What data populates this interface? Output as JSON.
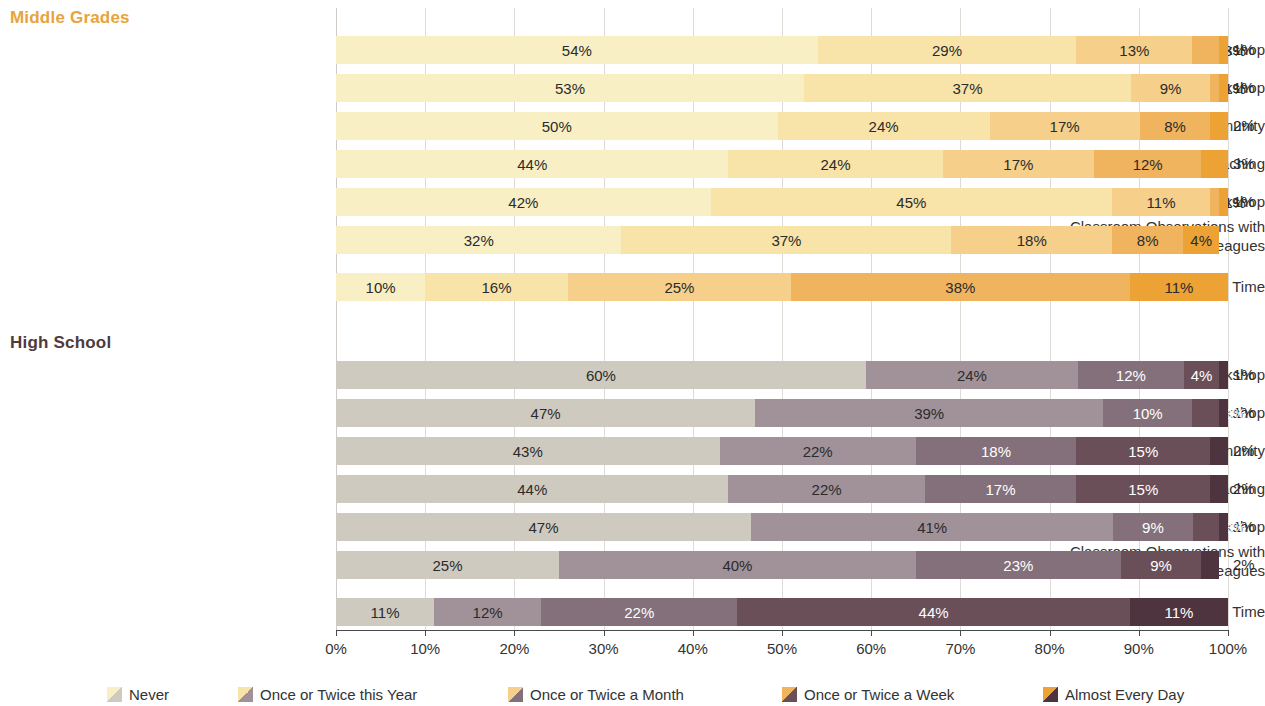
{
  "chart_data": {
    "type": "bar",
    "subtype": "stacked-horizontal-100pct",
    "title": "",
    "xlabel": "",
    "ylabel": "",
    "xlim": [
      0,
      100
    ],
    "grid": true,
    "legend_position": "bottom",
    "x_ticks": [
      "0%",
      "10%",
      "20%",
      "30%",
      "40%",
      "50%",
      "60%",
      "70%",
      "80%",
      "90%",
      "100%"
    ],
    "x_tick_values": [
      0,
      10,
      20,
      30,
      40,
      50,
      60,
      70,
      80,
      90,
      100
    ],
    "legend": [
      "Never",
      "Once or Twice this Year",
      "Once or Twice a Month",
      "Once or Twice a Week",
      "Almost Every Day"
    ],
    "categories": [
      "After-School Workshop",
      "Half-Day Workshop",
      "Professional Learning Community",
      "Instructional Coaching",
      "Full-Day Workshop",
      "Classroom Observations with\nOther Colleagues",
      "Collaborative Planning Time"
    ],
    "groups": [
      {
        "name": "Middle Grades",
        "palette": [
          "#f8efc4",
          "#f8e3a8",
          "#f6cf8a",
          "#f0b45e",
          "#eca234"
        ],
        "header_color": "#e8a33d",
        "rows": [
          {
            "category": "After-School Workshop",
            "values": [
              54,
              29,
              13,
              3,
              1
            ],
            "labels": [
              "54%",
              "29%",
              "13%",
              "3%",
              "1%"
            ]
          },
          {
            "category": "Half-Day Workshop",
            "values": [
              53,
              37,
              9,
              1,
              1
            ],
            "labels": [
              "53%",
              "37%",
              "9%",
              "1%",
              "1%"
            ]
          },
          {
            "category": "Professional Learning Community",
            "values": [
              50,
              24,
              17,
              8,
              2
            ],
            "labels": [
              "50%",
              "24%",
              "17%",
              "8%",
              "2%"
            ]
          },
          {
            "category": "Instructional Coaching",
            "values": [
              44,
              24,
              17,
              12,
              3
            ],
            "labels": [
              "44%",
              "24%",
              "17%",
              "12%",
              "3%"
            ]
          },
          {
            "category": "Full-Day Workshop",
            "values": [
              42,
              45,
              11,
              1,
              1
            ],
            "labels": [
              "42%",
              "45%",
              "11%",
              "1%",
              "1%"
            ]
          },
          {
            "category": "Classroom Observations with\nOther Colleagues",
            "values": [
              32,
              37,
              18,
              8,
              4
            ],
            "labels": [
              "32%",
              "37%",
              "18%",
              "8%",
              "4%"
            ]
          },
          {
            "category": "Collaborative Planning Time",
            "values": [
              10,
              16,
              25,
              38,
              11
            ],
            "labels": [
              "10%",
              "16%",
              "25%",
              "38%",
              "11%"
            ]
          }
        ]
      },
      {
        "name": "High School",
        "palette": [
          "#cfcabf",
          "#a1929a",
          "#83707a",
          "#6a4f59",
          "#4e343e"
        ],
        "header_color": "#4f3a40",
        "rows": [
          {
            "category": "After-School Workshop",
            "values": [
              60,
              24,
              12,
              4,
              1
            ],
            "labels": [
              "60%",
              "24%",
              "12%",
              "4%",
              "1%"
            ]
          },
          {
            "category": "Half-Day Workshop",
            "values": [
              47,
              39,
              10,
              3,
              1
            ],
            "labels": [
              "47%",
              "39%",
              "10%",
              "3%",
              "1%"
            ]
          },
          {
            "category": "Professional Learning Community",
            "values": [
              43,
              22,
              18,
              15,
              2
            ],
            "labels": [
              "43%",
              "22%",
              "18%",
              "15%",
              "2%"
            ]
          },
          {
            "category": "Instructional Coaching",
            "values": [
              44,
              22,
              17,
              15,
              2
            ],
            "labels": [
              "44%",
              "22%",
              "17%",
              "15%",
              "2%"
            ]
          },
          {
            "category": "Full-Day Workshop",
            "values": [
              47,
              41,
              9,
              3,
              1
            ],
            "labels": [
              "47%",
              "41%",
              "9%",
              "3%",
              "1%"
            ]
          },
          {
            "category": "Classroom Observations with\nOther Colleagues",
            "values": [
              25,
              40,
              23,
              9,
              2
            ],
            "labels": [
              "25%",
              "40%",
              "23%",
              "9%",
              "2%"
            ]
          },
          {
            "category": "Collaborative Planning Time",
            "values": [
              11,
              12,
              22,
              44,
              11
            ],
            "labels": [
              "11%",
              "12%",
              "22%",
              "44%",
              "11%"
            ]
          }
        ]
      }
    ]
  }
}
